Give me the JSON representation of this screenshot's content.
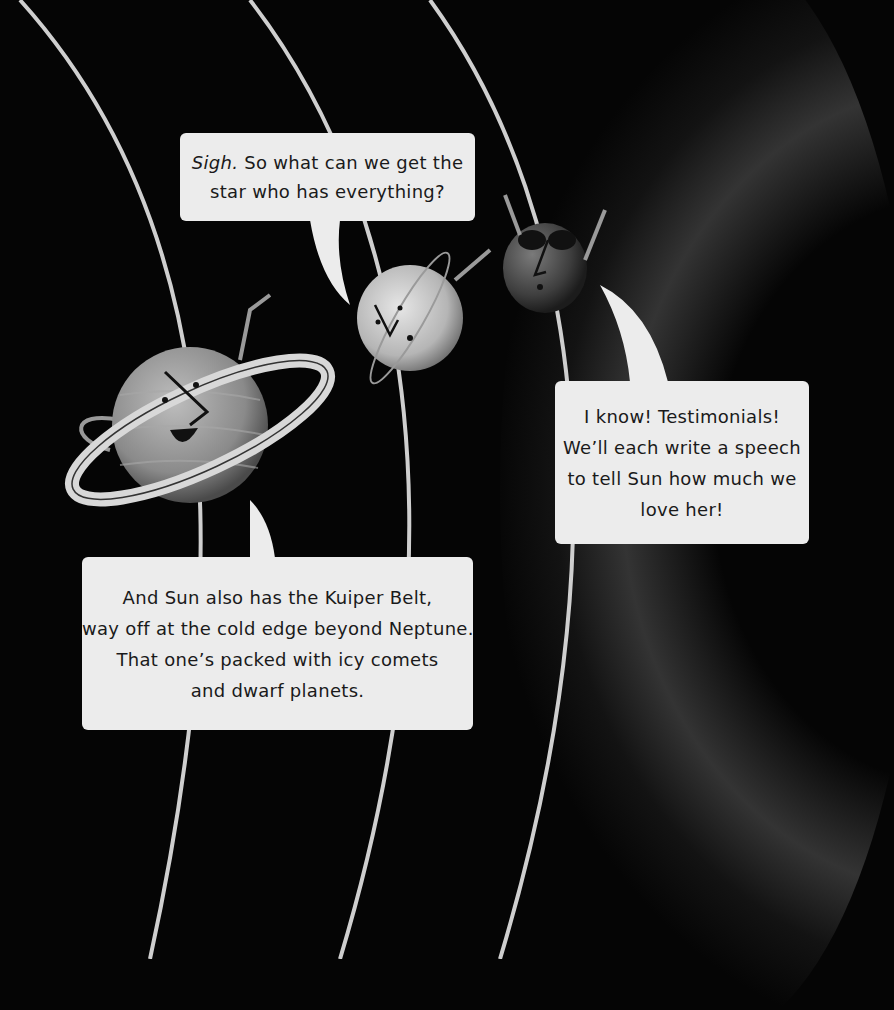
{
  "scene": {
    "background_color": "#050505",
    "orbit_color": "#cfcfcf",
    "bubble_color": "#ececec",
    "characters": [
      {
        "name": "Saturn",
        "icon": "saturn-character-icon",
        "expression": "smiling, waving, hula-hooping ring"
      },
      {
        "name": "Uranus",
        "icon": "uranus-character-icon",
        "expression": "sighing, tilted ring"
      },
      {
        "name": "Neptune",
        "icon": "neptune-character-icon",
        "expression": "sunglasses, arms raised"
      }
    ]
  },
  "bubbles": {
    "sigh": {
      "emphasis": "Sigh.",
      "line1_rest": " So what can we get the",
      "line2": "star who has everything?"
    },
    "testimonials": {
      "lines": [
        "I know! Testimonials!",
        "We’ll each write a speech",
        "to tell Sun how much we",
        "love her!"
      ]
    },
    "kuiper": {
      "lines": [
        "And Sun also has the Kuiper Belt,",
        "way off at the cold edge beyond Neptune.",
        "That one’s packed with icy comets",
        "and dwarf planets."
      ]
    }
  }
}
